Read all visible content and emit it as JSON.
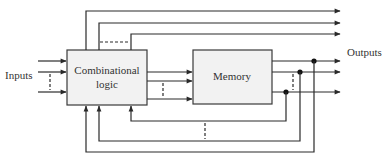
{
  "diagram": {
    "labels": {
      "inputs": "Inputs",
      "outputs": "Outputs",
      "combinational_line1": "Combinational",
      "combinational_line2": "logic",
      "memory": "Memory"
    },
    "blocks": [
      {
        "id": "combinational-logic",
        "label": "Combinational logic"
      },
      {
        "id": "memory",
        "label": "Memory"
      }
    ],
    "colors": {
      "line": "#2a2a2a",
      "box_fill": "#f2f2f2",
      "box_stroke": "#3a3a3a",
      "text": "#333333"
    },
    "inputs_count_shown": 3,
    "top_outputs_count": 3,
    "memory_outputs_count": 3,
    "feedback_paths_count": 3
  }
}
